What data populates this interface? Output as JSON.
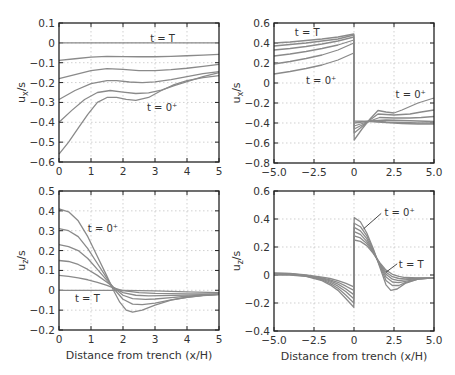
{
  "chart_data": [
    {
      "id": "top-left",
      "type": "line",
      "title": "",
      "xlabel": "",
      "ylabel": "u_x/s",
      "xlim": [
        0,
        5
      ],
      "ylim": [
        -0.6,
        0.1
      ],
      "xticks": [
        0,
        1,
        2,
        3,
        4,
        5
      ],
      "xtick_labels": [
        "0",
        "1",
        "2",
        "3",
        "4",
        "5"
      ],
      "yticks": [
        0.1,
        0,
        -0.1,
        -0.2,
        -0.3,
        -0.4,
        -0.5,
        -0.6
      ],
      "ytick_labels": [
        "0.1",
        "0",
        "−0.1",
        "−0.2",
        "−0.3",
        "−0.4",
        "−0.5",
        "−0.6"
      ],
      "grid": true,
      "frame": {
        "left": 59,
        "top": 23,
        "right": 219,
        "bottom": 162
      },
      "annotations": [
        {
          "text": "t = T",
          "x": 2.85,
          "y": 0.02
        },
        {
          "text": "t = 0⁺",
          "x": 2.75,
          "y": -0.33
        }
      ],
      "series": [
        {
          "name": "t=T",
          "x": [
            0,
            1,
            2,
            3,
            4,
            5
          ],
          "y": [
            0,
            0,
            0,
            0,
            0,
            0
          ]
        },
        {
          "name": "s2",
          "x": [
            0,
            0.5,
            1,
            1.5,
            2,
            2.5,
            3,
            3.5,
            4,
            4.5,
            5
          ],
          "y": [
            -0.088,
            -0.08,
            -0.072,
            -0.068,
            -0.069,
            -0.07,
            -0.07,
            -0.068,
            -0.065,
            -0.062,
            -0.058
          ]
        },
        {
          "name": "s3",
          "x": [
            0,
            0.5,
            1,
            1.5,
            2,
            2.5,
            3,
            3.5,
            4,
            4.5,
            5
          ],
          "y": [
            -0.18,
            -0.16,
            -0.14,
            -0.13,
            -0.134,
            -0.14,
            -0.14,
            -0.135,
            -0.128,
            -0.118,
            -0.108
          ]
        },
        {
          "name": "s4",
          "x": [
            0,
            0.5,
            1,
            1.5,
            1.8,
            2.2,
            2.6,
            3,
            3.5,
            4,
            4.5,
            5
          ],
          "y": [
            -0.285,
            -0.24,
            -0.205,
            -0.19,
            -0.19,
            -0.197,
            -0.2,
            -0.196,
            -0.185,
            -0.17,
            -0.155,
            -0.145
          ]
        },
        {
          "name": "s5",
          "x": [
            0,
            0.4,
            0.8,
            1.2,
            1.6,
            2.0,
            2.4,
            2.8,
            3.2,
            3.6,
            4,
            4.5,
            5
          ],
          "y": [
            -0.4,
            -0.34,
            -0.285,
            -0.25,
            -0.24,
            -0.248,
            -0.255,
            -0.252,
            -0.238,
            -0.215,
            -0.195,
            -0.17,
            -0.15
          ]
        },
        {
          "name": "t=0+",
          "x": [
            0,
            0.3,
            0.6,
            0.9,
            1.2,
            1.5,
            1.8,
            2.1,
            2.4,
            2.8,
            3.2,
            3.6,
            4,
            4.5,
            5
          ],
          "y": [
            -0.56,
            -0.5,
            -0.43,
            -0.36,
            -0.3,
            -0.275,
            -0.275,
            -0.285,
            -0.29,
            -0.275,
            -0.24,
            -0.21,
            -0.19,
            -0.175,
            -0.165
          ]
        }
      ]
    },
    {
      "id": "top-right",
      "type": "line",
      "title": "",
      "xlabel": "",
      "ylabel": "u_x/s",
      "xlim": [
        -5,
        5
      ],
      "ylim": [
        -0.8,
        0.6
      ],
      "xticks": [
        -5,
        -2.5,
        0,
        2.5,
        5
      ],
      "xtick_labels": [
        "−5.0",
        "−2.5",
        "0",
        "2.5",
        "5.0"
      ],
      "yticks": [
        0.6,
        0.4,
        0.2,
        0,
        -0.2,
        -0.4,
        -0.6,
        -0.8
      ],
      "ytick_labels": [
        "0.6",
        "0.4",
        "0.2",
        "0",
        "−0.2",
        "−0.4",
        "−0.6",
        "−0.8"
      ],
      "grid": true,
      "frame": {
        "left": 274,
        "top": 23,
        "right": 434,
        "bottom": 163
      },
      "annotations": [
        {
          "text": "t = T",
          "x": -3.7,
          "y": 0.5
        },
        {
          "text": "t = 0⁺",
          "x": -3.0,
          "y": 0.02
        },
        {
          "text": "t = 0⁺",
          "x": 2.6,
          "y": -0.12
        }
      ],
      "series": [
        {
          "name": "t=T",
          "x": [
            -5,
            -4,
            -3,
            -2,
            -1,
            -0.01,
            0.01,
            1,
            2,
            3,
            4,
            5
          ],
          "y": [
            0.4,
            0.41,
            0.425,
            0.44,
            0.46,
            0.49,
            -0.38,
            -0.385,
            -0.395,
            -0.405,
            -0.41,
            -0.41
          ]
        },
        {
          "name": "s2",
          "x": [
            -5,
            -4,
            -3,
            -2,
            -1,
            -0.01,
            0.01,
            1,
            2,
            3,
            4,
            5
          ],
          "y": [
            0.37,
            0.385,
            0.4,
            0.42,
            0.44,
            0.48,
            -0.4,
            -0.38,
            -0.39,
            -0.395,
            -0.4,
            -0.4
          ]
        },
        {
          "name": "s3",
          "x": [
            -5,
            -4,
            -3,
            -2,
            -1,
            -0.01,
            0.01,
            1,
            2,
            3,
            4,
            5
          ],
          "y": [
            0.33,
            0.345,
            0.365,
            0.39,
            0.42,
            0.46,
            -0.43,
            -0.38,
            -0.37,
            -0.375,
            -0.38,
            -0.385
          ]
        },
        {
          "name": "s4",
          "x": [
            -5,
            -4,
            -3,
            -2,
            -1,
            -0.01,
            0.01,
            1,
            1.6,
            2.5,
            3.5,
            4.2,
            5
          ],
          "y": [
            0.27,
            0.29,
            0.315,
            0.345,
            0.38,
            0.43,
            -0.46,
            -0.38,
            -0.345,
            -0.35,
            -0.35,
            -0.345,
            -0.335
          ]
        },
        {
          "name": "s5",
          "x": [
            -5,
            -4,
            -3,
            -2,
            -1,
            -0.01,
            0.01,
            1,
            1.5,
            2.5,
            3.5,
            4.2,
            5
          ],
          "y": [
            0.19,
            0.215,
            0.245,
            0.28,
            0.33,
            0.4,
            -0.5,
            -0.37,
            -0.31,
            -0.32,
            -0.31,
            -0.29,
            -0.27
          ]
        },
        {
          "name": "t=0+",
          "x": [
            -5,
            -4,
            -3,
            -2,
            -1,
            -0.01,
            0.01,
            0.5,
            1,
            1.5,
            2,
            2.5,
            3,
            4,
            5
          ],
          "y": [
            0.09,
            0.115,
            0.145,
            0.18,
            0.23,
            0.3,
            -0.57,
            -0.46,
            -0.36,
            -0.275,
            -0.29,
            -0.3,
            -0.27,
            -0.2,
            -0.15
          ]
        }
      ]
    },
    {
      "id": "bottom-left",
      "type": "line",
      "title": "",
      "xlabel": "Distance from trench (x/H)",
      "ylabel": "u_z/s",
      "xlim": [
        0,
        5
      ],
      "ylim": [
        -0.2,
        0.5
      ],
      "xticks": [
        0,
        1,
        2,
        3,
        4,
        5
      ],
      "xtick_labels": [
        "0",
        "1",
        "2",
        "3",
        "4",
        "5"
      ],
      "yticks": [
        0.5,
        0.4,
        0.3,
        0.2,
        0.1,
        0,
        -0.1,
        -0.2
      ],
      "ytick_labels": [
        "0.5",
        "0.4",
        "0.3",
        "0.2",
        "0.1",
        "0",
        "−0.1",
        "−0.2"
      ],
      "grid": true,
      "frame": {
        "left": 59,
        "top": 191,
        "right": 219,
        "bottom": 330
      },
      "annotations": [
        {
          "text": "t = 0⁺",
          "x": 0.9,
          "y": 0.31
        },
        {
          "text": "t = T",
          "x": 0.5,
          "y": -0.045
        }
      ],
      "series": [
        {
          "name": "t=0+",
          "x": [
            0,
            0.3,
            0.6,
            0.9,
            1.2,
            1.5,
            1.7,
            1.9,
            2.1,
            2.3,
            2.6,
            3,
            3.5,
            4,
            4.5,
            5
          ],
          "y": [
            0.41,
            0.395,
            0.35,
            0.27,
            0.17,
            0.07,
            0.0,
            -0.06,
            -0.1,
            -0.11,
            -0.1,
            -0.075,
            -0.05,
            -0.035,
            -0.025,
            -0.02
          ]
        },
        {
          "name": "s2",
          "x": [
            0,
            0.3,
            0.6,
            0.9,
            1.2,
            1.5,
            1.7,
            2.0,
            2.3,
            2.6,
            3,
            3.5,
            4,
            4.5,
            5
          ],
          "y": [
            0.31,
            0.3,
            0.27,
            0.21,
            0.135,
            0.06,
            0.01,
            -0.045,
            -0.07,
            -0.072,
            -0.065,
            -0.048,
            -0.035,
            -0.027,
            -0.022
          ]
        },
        {
          "name": "s3",
          "x": [
            0,
            0.3,
            0.6,
            0.9,
            1.2,
            1.5,
            1.7,
            2.0,
            2.3,
            2.7,
            3,
            3.5,
            4,
            4.5,
            5
          ],
          "y": [
            0.23,
            0.22,
            0.2,
            0.16,
            0.105,
            0.05,
            0.015,
            -0.025,
            -0.042,
            -0.046,
            -0.044,
            -0.037,
            -0.03,
            -0.025,
            -0.021
          ]
        },
        {
          "name": "s4",
          "x": [
            0,
            0.3,
            0.6,
            0.9,
            1.2,
            1.5,
            1.7,
            2.0,
            2.4,
            2.8,
            3.2,
            4,
            5
          ],
          "y": [
            0.15,
            0.145,
            0.13,
            0.105,
            0.075,
            0.04,
            0.015,
            -0.012,
            -0.025,
            -0.028,
            -0.027,
            -0.024,
            -0.02
          ]
        },
        {
          "name": "s5",
          "x": [
            0,
            0.3,
            0.6,
            0.9,
            1.2,
            1.5,
            1.7,
            2.0,
            2.5,
            3,
            4,
            5
          ],
          "y": [
            0.075,
            0.07,
            0.063,
            0.053,
            0.04,
            0.025,
            0.012,
            -0.002,
            -0.012,
            -0.016,
            -0.018,
            -0.018
          ]
        },
        {
          "name": "t=T",
          "x": [
            0,
            1,
            2,
            3,
            4,
            5
          ],
          "y": [
            0,
            0,
            0,
            -0.003,
            -0.008,
            -0.012
          ]
        }
      ]
    },
    {
      "id": "bottom-right",
      "type": "line",
      "title": "",
      "xlabel": "Distance from trench (x/H)",
      "ylabel": "u_z/s",
      "xlim": [
        -5,
        5
      ],
      "ylim": [
        -0.4,
        0.6
      ],
      "xticks": [
        -5,
        -2.5,
        0,
        2.5,
        5
      ],
      "xtick_labels": [
        "−5.0",
        "−2.5",
        "0",
        "2.5",
        "5.0"
      ],
      "yticks": [
        0.6,
        0.4,
        0.2,
        0,
        -0.2,
        -0.4
      ],
      "ytick_labels": [
        "0.6",
        "0.4",
        "0.2",
        "0",
        "−0.2",
        "−0.4"
      ],
      "grid": true,
      "frame": {
        "left": 274,
        "top": 191,
        "right": 434,
        "bottom": 331
      },
      "annotations": [
        {
          "text": "t = 0⁺",
          "x": 1.9,
          "y": 0.44
        },
        {
          "text": "t = T",
          "x": 2.8,
          "y": 0.07
        }
      ],
      "leaders": [
        {
          "x1": 0.6,
          "y1": 0.33,
          "x2": 1.7,
          "y2": 0.44
        },
        {
          "x1": 2.0,
          "y1": 0.02,
          "x2": 2.7,
          "y2": 0.08
        }
      ],
      "series": [
        {
          "name": "t=0+",
          "x": [
            -5,
            -4,
            -3,
            -2,
            -1.5,
            -1,
            -0.5,
            -0.01,
            0.01,
            0.4,
            0.8,
            1.2,
            1.6,
            2.0,
            2.3,
            2.7,
            3.2,
            4,
            5
          ],
          "y": [
            0.0,
            0.0,
            -0.01,
            -0.04,
            -0.07,
            -0.11,
            -0.17,
            -0.23,
            0.41,
            0.38,
            0.3,
            0.19,
            0.06,
            -0.07,
            -0.11,
            -0.1,
            -0.06,
            -0.03,
            -0.02
          ]
        },
        {
          "name": "s2",
          "x": [
            -5,
            -4,
            -3,
            -2,
            -1.5,
            -1,
            -0.5,
            -0.01,
            0.01,
            0.4,
            0.8,
            1.2,
            1.6,
            2.0,
            2.4,
            2.8,
            3.2,
            4,
            5
          ],
          "y": [
            0.005,
            0.003,
            -0.008,
            -0.035,
            -0.06,
            -0.095,
            -0.145,
            -0.2,
            0.37,
            0.345,
            0.28,
            0.18,
            0.07,
            -0.04,
            -0.075,
            -0.075,
            -0.055,
            -0.03,
            -0.02
          ]
        },
        {
          "name": "s3",
          "x": [
            -5,
            -4,
            -3,
            -2,
            -1.5,
            -1,
            -0.5,
            -0.01,
            0.01,
            0.4,
            0.8,
            1.2,
            1.6,
            2.0,
            2.4,
            2.8,
            3.2,
            4,
            5
          ],
          "y": [
            0.008,
            0.005,
            -0.006,
            -0.03,
            -0.05,
            -0.08,
            -0.12,
            -0.17,
            0.34,
            0.315,
            0.26,
            0.17,
            0.075,
            -0.015,
            -0.05,
            -0.055,
            -0.045,
            -0.028,
            -0.02
          ]
        },
        {
          "name": "s4",
          "x": [
            -5,
            -4,
            -3,
            -2,
            -1.5,
            -1,
            -0.5,
            -0.01,
            0.01,
            0.4,
            0.8,
            1.2,
            1.6,
            2.0,
            2.4,
            2.8,
            3.2,
            4,
            5
          ],
          "y": [
            0.01,
            0.007,
            -0.004,
            -0.025,
            -0.042,
            -0.065,
            -0.1,
            -0.14,
            0.31,
            0.29,
            0.24,
            0.165,
            0.08,
            0.005,
            -0.03,
            -0.04,
            -0.035,
            -0.025,
            -0.02
          ]
        },
        {
          "name": "s5",
          "x": [
            -5,
            -4,
            -3,
            -2,
            -1.5,
            -1,
            -0.5,
            -0.01,
            0.01,
            0.4,
            0.8,
            1.2,
            1.6,
            2.0,
            2.4,
            2.8,
            3.2,
            4,
            5
          ],
          "y": [
            0.012,
            0.009,
            -0.002,
            -0.02,
            -0.035,
            -0.052,
            -0.08,
            -0.11,
            0.28,
            0.265,
            0.225,
            0.16,
            0.085,
            0.02,
            -0.012,
            -0.025,
            -0.028,
            -0.022,
            -0.02
          ]
        },
        {
          "name": "t=T",
          "x": [
            -5,
            -4,
            -3,
            -2,
            -1.5,
            -1,
            -0.5,
            -0.01,
            0.01,
            0.4,
            0.8,
            1.2,
            1.6,
            2.0,
            2.4,
            2.8,
            3.2,
            4,
            5
          ],
          "y": [
            0.015,
            0.012,
            0.0,
            -0.015,
            -0.025,
            -0.04,
            -0.06,
            -0.085,
            0.25,
            0.24,
            0.21,
            0.155,
            0.09,
            0.035,
            0.005,
            -0.01,
            -0.018,
            -0.02,
            -0.02
          ]
        }
      ]
    }
  ]
}
